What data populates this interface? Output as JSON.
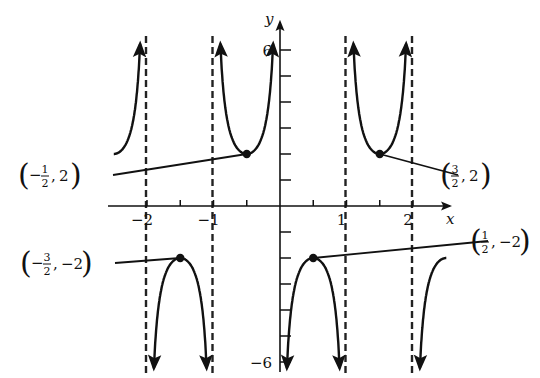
{
  "chart_data": {
    "type": "line",
    "title": "",
    "function": "y = -2 csc(πx)",
    "xlabel": "x",
    "ylabel": "y",
    "xlim": [
      -2.5,
      2.5
    ],
    "ylim": [
      -6,
      6
    ],
    "x_ticks": [
      -2,
      -1.5,
      -1,
      -0.5,
      0,
      0.5,
      1,
      1.5,
      2
    ],
    "x_tick_labels": [
      {
        "value": -2,
        "label": "−2"
      },
      {
        "value": -1,
        "label": "−1"
      },
      {
        "value": 1,
        "label": "1"
      },
      {
        "value": 2,
        "label": "2"
      }
    ],
    "y_ticks": [
      -6,
      -5,
      -4,
      -3,
      -2,
      -1,
      1,
      2,
      3,
      4,
      5,
      6
    ],
    "y_tick_labels": [
      {
        "value": 6,
        "label": "6"
      },
      {
        "value": -6,
        "label": "−6"
      }
    ],
    "vertical_asymptotes": [
      -2,
      -1,
      0,
      1,
      2
    ],
    "branches": [
      {
        "x_from": -2.5,
        "x_to": -2.03,
        "direction": "up"
      },
      {
        "x_from": -1.97,
        "x_to": -1.03,
        "direction": "down"
      },
      {
        "x_from": -0.97,
        "x_to": -0.03,
        "direction": "up"
      },
      {
        "x_from": 0.03,
        "x_to": 0.97,
        "direction": "down"
      },
      {
        "x_from": 1.03,
        "x_to": 1.97,
        "direction": "up"
      },
      {
        "x_from": 2.03,
        "x_to": 2.5,
        "direction": "down"
      }
    ],
    "annotated_points": [
      {
        "x": -0.5,
        "y": 2,
        "label_sign": "−",
        "label_num": "1",
        "label_den": "2",
        "label_y": "2",
        "label_pos": [
          58,
          175
        ]
      },
      {
        "x": 1.5,
        "y": 2,
        "label_sign": "",
        "label_num": "3",
        "label_den": "2",
        "label_y": "2",
        "label_pos": [
          470,
          175
        ]
      },
      {
        "x": -1.5,
        "y": -2,
        "label_sign": "−",
        "label_num": "3",
        "label_den": "2",
        "label_y": "−2",
        "label_pos": [
          60,
          263
        ]
      },
      {
        "x": 0.5,
        "y": -2,
        "label_sign": "",
        "label_num": "1",
        "label_den": "2",
        "label_y": "−2",
        "label_pos": [
          500,
          241
        ]
      }
    ],
    "grid": false,
    "legend": null,
    "colors": {
      "curve": "#111111",
      "axis": "#111111",
      "asymptote": "#222222"
    }
  }
}
